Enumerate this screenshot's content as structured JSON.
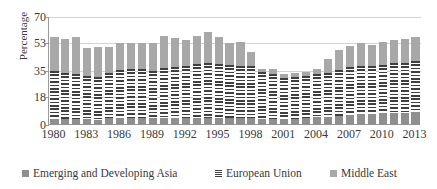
{
  "chart_data": {
    "type": "bar",
    "subtype": "stacked-bar",
    "title": "",
    "xlabel": "",
    "ylabel": "Percentage",
    "ylim": [
      0,
      70
    ],
    "yticks": [
      0,
      18,
      35,
      53,
      70
    ],
    "grid": true,
    "legend_position": "bottom",
    "categories": [
      "1980",
      "1981",
      "1982",
      "1983",
      "1984",
      "1985",
      "1986",
      "1987",
      "1988",
      "1989",
      "1990",
      "1991",
      "1992",
      "1993",
      "1994",
      "1995",
      "1996",
      "1997",
      "1998",
      "1999",
      "2000",
      "2001",
      "2002",
      "2003",
      "2004",
      "2005",
      "2006",
      "2007",
      "2008",
      "2009",
      "2010",
      "2011",
      "2012",
      "2013"
    ],
    "xtick_labels": [
      "1980",
      "1983",
      "1986",
      "1989",
      "1992",
      "1995",
      "1998",
      "2001",
      "2004",
      "2007",
      "2010",
      "2013"
    ],
    "series": [
      {
        "name": "Emerging and Developing Asia",
        "color": "#8f8f8f",
        "pattern": "solid",
        "values": [
          4.0,
          4.0,
          4.0,
          4.0,
          3.5,
          4.5,
          4.5,
          4.5,
          4.5,
          4.5,
          4.5,
          4.5,
          4.5,
          4.5,
          4.5,
          4.5,
          4.5,
          4.5,
          4.5,
          4.0,
          4.0,
          4.0,
          4.0,
          4.5,
          5.0,
          5.5,
          6.0,
          6.5,
          7.0,
          7.0,
          7.5,
          8.0,
          8.0,
          8.5
        ]
      },
      {
        "name": "European Union",
        "color": "#3f3f3f",
        "pattern": "horizontal-stripes",
        "values": [
          31.0,
          30.0,
          29.0,
          28.0,
          27.5,
          29.0,
          31.0,
          31.5,
          31.5,
          30.5,
          32.5,
          33.0,
          33.5,
          35.0,
          35.5,
          35.0,
          34.5,
          33.5,
          34.0,
          30.5,
          29.0,
          26.5,
          27.0,
          27.5,
          28.0,
          28.0,
          29.5,
          31.0,
          31.0,
          31.0,
          31.5,
          32.0,
          32.5,
          33.0
        ]
      },
      {
        "name": "Middle East",
        "color": "#a8a8a8",
        "pattern": "solid",
        "values": [
          22.0,
          22.0,
          24.0,
          18.0,
          19.5,
          17.0,
          17.5,
          17.0,
          17.0,
          18.0,
          20.5,
          19.0,
          17.0,
          18.5,
          20.5,
          17.5,
          14.0,
          15.5,
          9.0,
          2.0,
          3.0,
          2.5,
          2.5,
          2.5,
          3.0,
          9.0,
          13.0,
          14.0,
          15.0,
          14.0,
          15.0,
          15.0,
          15.5,
          15.5
        ]
      }
    ],
    "totals": [
      57.0,
      56.0,
      57.0,
      50.0,
      50.5,
      50.5,
      53.0,
      53.0,
      53.0,
      53.0,
      57.5,
      56.5,
      55.0,
      58.0,
      60.5,
      57.0,
      53.0,
      53.5,
      47.5,
      36.5,
      36.0,
      33.0,
      33.5,
      34.5,
      36.0,
      42.5,
      48.5,
      51.5,
      53.0,
      52.0,
      54.0,
      55.0,
      56.0,
      57.0
    ],
    "legend": [
      {
        "label": "Emerging and Developing Asia",
        "swatch": "legend-swatch-asia"
      },
      {
        "label": "European Union",
        "swatch": "legend-swatch-eu"
      },
      {
        "label": "Middle East",
        "swatch": "legend-swatch-middle-east"
      }
    ]
  }
}
